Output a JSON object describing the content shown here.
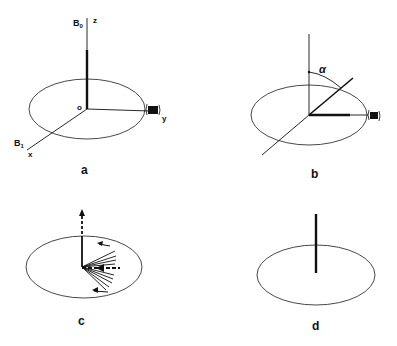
{
  "panels": {
    "a": {
      "label": "a",
      "axis_z": "z",
      "axis_y": "y",
      "axis_x": "x",
      "origin": "o",
      "field_b0": "B",
      "field_b0_sub": "0",
      "field_b1": "B",
      "field_b1_sub": "1"
    },
    "b": {
      "label": "b",
      "angle": "α"
    },
    "c": {
      "label": "c"
    },
    "d": {
      "label": "d"
    }
  },
  "colors": {
    "ink": "#111111",
    "ellipse": "#333333",
    "background": "#ffffff"
  }
}
